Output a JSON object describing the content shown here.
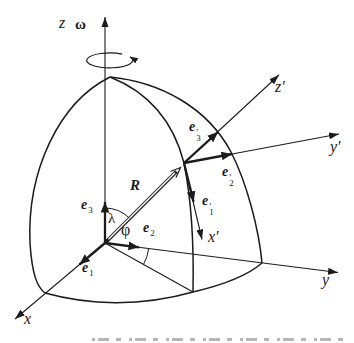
{
  "diagram": {
    "background": "#ffffff",
    "ink_color": "#1b1b1b",
    "labels": {
      "z": "z",
      "omega": "ω",
      "x": "x",
      "y": "y",
      "x_prime": "x′",
      "y_prime": "y′",
      "z_prime": "z′",
      "R": "R",
      "lambda": "λ",
      "phi": "φ"
    },
    "vectors": {
      "e1": {
        "base": "e",
        "sub": "1"
      },
      "e2": {
        "base": "e",
        "sub": "2"
      },
      "e3": {
        "base": "e",
        "sub": "3"
      },
      "e1_prime": {
        "base": "e",
        "prime": "′",
        "sub": "1"
      },
      "e2_prime": {
        "base": "e",
        "prime": "′",
        "sub": "2"
      },
      "e3_prime": {
        "base": "e",
        "prime": "′",
        "sub": "3"
      }
    }
  }
}
